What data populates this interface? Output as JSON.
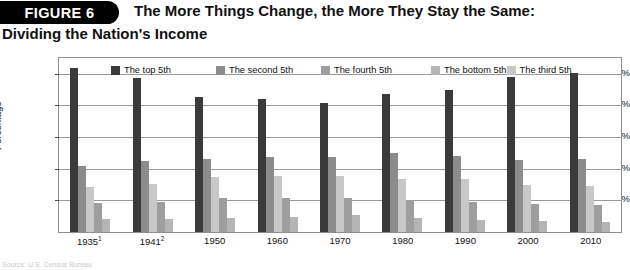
{
  "figure": {
    "badge": "FIGURE 6",
    "title_line1": "The More Things Change, the More They Stay the Same:",
    "title_line2": "Dividing the Nation's Income",
    "footnote": "Source: U.S. Census Bureau"
  },
  "chart_data": {
    "type": "bar",
    "title": "The More Things Change, the More They Stay the Same: Dividing the Nation's Income",
    "xlabel": "",
    "ylabel": "Percentage",
    "ylim": [
      0,
      55
    ],
    "yticks": [
      "10%",
      "20%",
      "30%",
      "40%",
      "50%"
    ],
    "ytick_values": [
      10,
      20,
      30,
      40,
      50
    ],
    "grid": true,
    "legend_position": "top-inside",
    "categories": [
      "1935",
      "1941",
      "1950",
      "1960",
      "1970",
      "1980",
      "1990",
      "2000",
      "2010"
    ],
    "category_labels": [
      "1935¹",
      "1941²",
      "1950",
      "1960",
      "1970",
      "1980",
      "1990",
      "2000",
      "2010"
    ],
    "category_footnote_marks": [
      "1",
      "2",
      "",
      "",
      "",
      "",
      "",
      "",
      ""
    ],
    "series": [
      {
        "name": "The top 5th",
        "color": "#3a3a3a",
        "values": [
          51.7,
          48.8,
          42.7,
          42.0,
          40.9,
          43.7,
          45.0,
          49.0,
          50.2
        ]
      },
      {
        "name": "The second 5th",
        "color": "#8c8c8c",
        "values": [
          20.9,
          22.3,
          23.1,
          23.6,
          23.8,
          24.9,
          24.0,
          22.9,
          23.1
        ]
      },
      {
        "name": "The third 5th",
        "color": "#c8c8c8",
        "values": [
          14.1,
          15.3,
          17.4,
          17.6,
          17.6,
          16.8,
          16.6,
          14.9,
          14.6
        ]
      },
      {
        "name": "The fourth 5th",
        "color": "#9e9e9e",
        "values": [
          9.2,
          9.5,
          10.9,
          10.6,
          10.8,
          10.2,
          9.6,
          8.9,
          8.4
        ]
      },
      {
        "name": "The bottom 5th",
        "color": "#b5b5b5",
        "values": [
          4.1,
          4.1,
          4.5,
          4.8,
          5.4,
          4.3,
          3.9,
          3.6,
          3.3
        ]
      }
    ],
    "legend_order": [
      "The top 5th",
      "The second 5th",
      "The fourth 5th",
      "The bottom 5th",
      "The third 5th"
    ]
  }
}
